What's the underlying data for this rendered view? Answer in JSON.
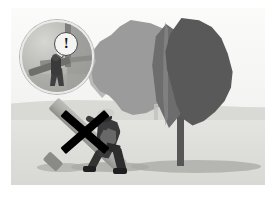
{
  "illustration": {
    "title": "Overhead power line hazard - carrying long pole near tree",
    "style": "grayscale safety pictogram",
    "background_color": "#f2f2f0",
    "page_background": "#ffffff"
  },
  "scene": {
    "sky_label": "sky",
    "ground_label": "ground",
    "horizon_label": "horizon",
    "ground_color": "#dedeDB",
    "horizon_color": "#d9d9d6"
  },
  "tree": {
    "label": "tree",
    "trunk_label": "tree-trunk",
    "trunk_color": "#575757",
    "canopy_light_label": "canopy light mass",
    "canopy_light_color": "#9b9b9b",
    "canopy_dark_label": "canopy dark mass",
    "canopy_dark_color": "#595959",
    "shadow_label": "tree shadow"
  },
  "worker": {
    "label": "worker carrying pole",
    "helmet_label": "hard hat",
    "helmet_color": "#cfcfcc",
    "body_color": "#3a3a3a",
    "vest_color": "#6e6e6e",
    "boots_color": "#1f1f1f",
    "shadow_label": "worker shadow"
  },
  "pole": {
    "label": "long carried pole",
    "color": "#a9a9a6",
    "cap_label": "pole end cap"
  },
  "prohibition": {
    "label": "prohibition cross",
    "symbol": "X",
    "color": "#000000",
    "meaning": "do not do this"
  },
  "distant_figure": {
    "label": "distant figure",
    "color": "#c2c2bf"
  },
  "inset": {
    "label": "circular detail inset",
    "border_color": "#b6b6b3",
    "warning_symbol": "!",
    "warning_label": "exclamation warning",
    "bubble_fill": "#f4f4f2",
    "bubble_stroke": "#4a4a4a",
    "worker_label": "inset worker carrying pole",
    "post_label": "inset utility post",
    "rail_label": "inset overhead line"
  }
}
